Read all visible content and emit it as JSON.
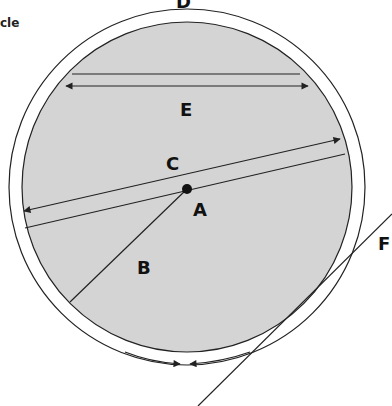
{
  "title_fragment": "cle",
  "colors": {
    "fill": "#d4d4d4",
    "stroke": "#222222",
    "background": "#ffffff"
  },
  "circle": {
    "cx": 187,
    "cy": 187,
    "inner_r": 165,
    "outer_r": 178
  },
  "labels": {
    "A": "A",
    "B": "B",
    "C": "C",
    "D": "D",
    "E": "E",
    "F": "F"
  }
}
